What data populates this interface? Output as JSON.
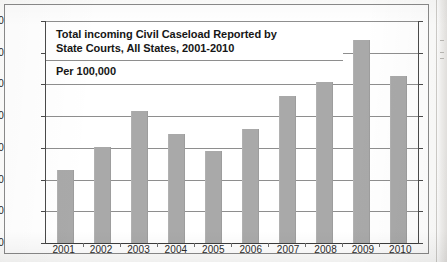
{
  "chart_data": {
    "type": "bar",
    "title": "Total incoming Civil Caseload Reported by State Courts, All States, 2001-2010",
    "title_line_1": "Total incoming Civil Caseload Reported by",
    "title_line_2": "State Courts, All States, 2001-2010",
    "subtitle": "Per 100,000",
    "xlabel": "",
    "ylabel": "",
    "ylim": [
      5000,
      6400
    ],
    "ytick_step": 200,
    "grid": true,
    "legend": "none",
    "bar_color": "#a9a9a9",
    "categories": [
      "2001",
      "2002",
      "2003",
      "2004",
      "2005",
      "2006",
      "2007",
      "2008",
      "2009",
      "2010"
    ],
    "values": [
      5460,
      5605,
      5835,
      5690,
      5580,
      5720,
      5930,
      6300,
      6280,
      6055
    ],
    "ytick_labels": [
      "6,400",
      "6,200",
      "6,000",
      "5,800",
      "5,600",
      "5,400",
      "5,200",
      "5,000"
    ],
    "ytick_values": [
      6400,
      6200,
      6000,
      5800,
      5600,
      5400,
      5200,
      5000
    ]
  }
}
